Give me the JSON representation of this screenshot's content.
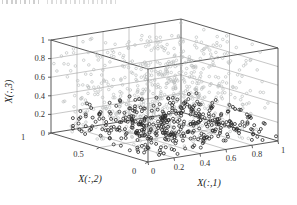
{
  "figure": {
    "kind": "matlab-style 3d scatter plot",
    "background": "#ffffff"
  },
  "chart_data": {
    "type": "scatter",
    "subtype": "scatter3d",
    "title": "",
    "xlabel": "X(:,1)",
    "ylabel": "X(:,2)",
    "zlabel": "X(:,3)",
    "xlim": [
      0,
      1
    ],
    "ylim": [
      0,
      1
    ],
    "zlim": [
      0,
      1
    ],
    "x_tick_values": [
      0,
      0.2,
      0.4,
      0.6,
      0.8,
      1
    ],
    "x_tick_labels": [
      "0",
      "0.2",
      "0.4",
      "0.6",
      "0.8",
      "1"
    ],
    "y_tick_values": [
      0,
      0.5,
      1
    ],
    "y_tick_labels": [
      "0",
      "0.5",
      "1"
    ],
    "z_tick_values": [
      0,
      0.2,
      0.4,
      0.6,
      0.8,
      1
    ],
    "z_tick_labels": [
      "0",
      "0.2",
      "0.4",
      "0.6",
      "0.8",
      "1"
    ],
    "grid": true,
    "box": true,
    "legend": "none",
    "view": {
      "azimuth": -37.5,
      "elevation": 30
    },
    "series": [
      {
        "name": "light-gray-cloud",
        "marker": "open-circle",
        "color": "#b9bcbc",
        "count": 620,
        "seed": 42,
        "x_range": [
          0,
          1
        ],
        "y_range": [
          0,
          1
        ],
        "z_range": [
          0.02,
          1
        ],
        "description": "unfilled light gray circles spread through the whole unit cube"
      },
      {
        "name": "dark-floor-cluster",
        "marker": "open-circle",
        "color": "#2b2b2b",
        "count": 400,
        "seed": 1337,
        "x_range": [
          0.08,
          1
        ],
        "y_range": [
          0,
          1
        ],
        "z_range": [
          0,
          0.28
        ],
        "description": "unfilled dark circles concentrated near the z=0 floor"
      }
    ],
    "colors": {
      "axis_line": "#3c3c3c",
      "grid_line": "#999999",
      "tick_label": "#333333"
    }
  }
}
